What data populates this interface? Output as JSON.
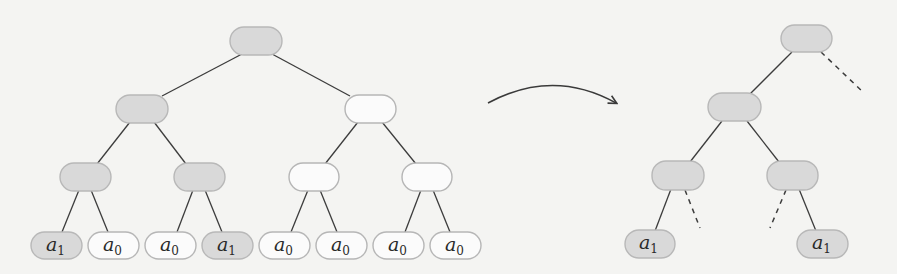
{
  "diagram": {
    "colors": {
      "highlighted_node": "#d9d9d9",
      "plain_node": "#fbfbfb",
      "edge": "#3c3c3c",
      "background": "#f4f4f2"
    },
    "left_tree": {
      "leaves": [
        {
          "symbol": "a",
          "subscript": "1",
          "highlighted": true
        },
        {
          "symbol": "a",
          "subscript": "0",
          "highlighted": false
        },
        {
          "symbol": "a",
          "subscript": "0",
          "highlighted": false
        },
        {
          "symbol": "a",
          "subscript": "1",
          "highlighted": true
        },
        {
          "symbol": "a",
          "subscript": "0",
          "highlighted": false
        },
        {
          "symbol": "a",
          "subscript": "0",
          "highlighted": false
        },
        {
          "symbol": "a",
          "subscript": "0",
          "highlighted": false
        },
        {
          "symbol": "a",
          "subscript": "0",
          "highlighted": false
        }
      ]
    },
    "arrow": {
      "direction": "right",
      "meaning": "transforms-to"
    },
    "right_tree": {
      "leaves": [
        {
          "symbol": "a",
          "subscript": "1",
          "highlighted": true
        },
        {
          "symbol": "a",
          "subscript": "1",
          "highlighted": true
        }
      ],
      "pruned_edges": "dashed"
    }
  }
}
